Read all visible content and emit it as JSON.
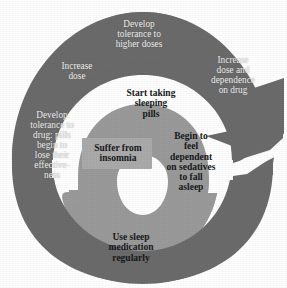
{
  "diagram": {
    "type": "spiral-cycle",
    "colors": {
      "background": "#ffffff",
      "outer_arm": "#6b6b6b",
      "inner_arm": "#9a9a9a",
      "hole": "#ffffff",
      "outer_label_text": "#f2f2f2",
      "inner_label_text": "#16181a",
      "insomnia_plate": "#aaaaaa"
    },
    "outer_arm_steps": [
      {
        "id": "develop-tolerance-higher-doses",
        "label": "Develop\ntolerance to\nhigher doses",
        "position": {
          "x": 96,
          "y": 19,
          "width": 86
        }
      },
      {
        "id": "increase-dose-and-dependence",
        "label": "Increase\ndose and\ndependence\non drug",
        "position": {
          "x": 196,
          "y": 55,
          "width": 74
        }
      },
      {
        "id": "increase-dose",
        "label": "Increase\ndose",
        "position": {
          "x": 44,
          "y": 61,
          "width": 66
        }
      },
      {
        "id": "develop-tolerance-drug-pills",
        "label": "Develop\ntolerance to\ndrug: pills\nbegin to\nlose their\neffective-\nness",
        "position": {
          "x": 16,
          "y": 110,
          "width": 72
        }
      },
      {
        "id": "use-sleep-medication-regularly",
        "label": "Use sleep\nmedication\nregularly",
        "position": {
          "x": 90,
          "y": 232,
          "width": 82
        }
      }
    ],
    "inner_arm_steps": [
      {
        "id": "start-taking-sleeping-pills",
        "label": "Start taking\nsleeping\npills",
        "position": {
          "x": 112,
          "y": 88,
          "width": 78
        }
      },
      {
        "id": "suffer-from-insomnia",
        "label": "Suffer from\ninsomnia",
        "position": {
          "x": 83,
          "y": 142,
          "width": 70
        }
      },
      {
        "id": "begin-to-feel-dependent",
        "label": "Begin to\nfeel\ndependent\non sedatives\nto fall\nasleep",
        "position": {
          "x": 155,
          "y": 131,
          "width": 72
        }
      }
    ]
  }
}
